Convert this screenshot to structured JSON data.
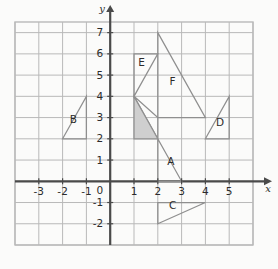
{
  "figure": {
    "type": "coordinate-plane",
    "title": "",
    "axes": {
      "x_label": "x",
      "y_label": "y",
      "origin_label": "0",
      "x_ticks": [
        "-3",
        "-2",
        "-1",
        "1",
        "2",
        "3",
        "4",
        "5"
      ],
      "x_tick_values": [
        -3,
        -2,
        -1,
        1,
        2,
        3,
        4,
        5
      ],
      "y_ticks": [
        "7",
        "6",
        "5",
        "4",
        "3",
        "2",
        "1",
        "-1",
        "-2"
      ],
      "y_tick_values": [
        7,
        6,
        5,
        4,
        3,
        2,
        1,
        -1,
        -2
      ],
      "xlim": [
        -4,
        6
      ],
      "ylim": [
        -3,
        7.5
      ],
      "grid": "on",
      "grid_step": 1
    },
    "colors": {
      "grid_line": "#b9b9b9",
      "axis_line": "#4a4a4a",
      "shape_stroke": "#8f8f8f",
      "shaded_fill": "#cfcfcf",
      "label_text": "#2b2b2b",
      "background": "#fbfbfa"
    },
    "shapes": [
      {
        "label": "A",
        "label_position": [
          2.55,
          0.75
        ],
        "vertices": [
          [
            1,
            4
          ],
          [
            3,
            0
          ],
          [
            2,
            0
          ],
          [
            2,
            3
          ]
        ],
        "filled": false,
        "note": "region bounded by diagonal from (1,4) to (3,0)"
      },
      {
        "label": "B",
        "label_position": [
          -1.55,
          2.75
        ],
        "vertices": [
          [
            -2,
            2
          ],
          [
            -1,
            4
          ],
          [
            -1,
            2
          ]
        ],
        "filled": false
      },
      {
        "label": "C",
        "label_position": [
          2.62,
          -1.3
        ],
        "vertices": [
          [
            2,
            -2
          ],
          [
            4,
            -1
          ],
          [
            2,
            -1
          ]
        ],
        "filled": false
      },
      {
        "label": "D",
        "label_position": [
          4.62,
          2.62
        ],
        "vertices": [
          [
            4,
            2
          ],
          [
            5,
            4
          ],
          [
            5,
            2
          ]
        ],
        "filled": false
      },
      {
        "label": "E",
        "label_position": [
          1.32,
          5.42
        ],
        "vertices": [
          [
            1,
            4
          ],
          [
            2,
            6
          ],
          [
            1,
            6
          ]
        ],
        "filled": false
      },
      {
        "label": "F",
        "label_position": [
          2.62,
          4.55
        ],
        "vertices": [
          [
            2,
            7
          ],
          [
            4,
            3
          ],
          [
            2,
            3
          ]
        ],
        "filled": false
      },
      {
        "label": "",
        "label_position": null,
        "vertices": [
          [
            1,
            4
          ],
          [
            2,
            2
          ],
          [
            1,
            2
          ]
        ],
        "filled": true,
        "note": "shaded grey triangle"
      }
    ]
  }
}
